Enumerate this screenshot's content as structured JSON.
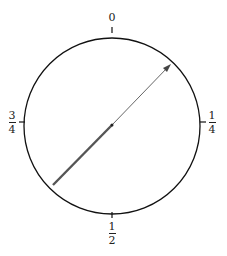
{
  "diagram": {
    "type": "phase-dial",
    "circle": {
      "cx": 112,
      "cy": 126,
      "r": 88,
      "stroke": "#111111"
    },
    "labels": {
      "top": "0",
      "right": {
        "num": "1",
        "den": "4"
      },
      "bottom": {
        "num": "1",
        "den": "2"
      },
      "left": {
        "num": "3",
        "den": "4"
      }
    },
    "arrow": {
      "from": [
        53,
        185
      ],
      "to": [
        171,
        64
      ],
      "color": "#444444",
      "center_dot": true,
      "note": "line thicker at tail end, thin near arrowhead"
    }
  }
}
